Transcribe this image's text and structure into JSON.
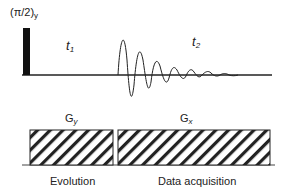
{
  "pulse": {
    "label_main": "(π/2)",
    "label_sub": "y"
  },
  "periods": {
    "t1_main": "t",
    "t1_sub": "1",
    "t2_main": "t",
    "t2_sub": "2"
  },
  "gradients": {
    "gy_main": "G",
    "gy_sub": "y",
    "gx_main": "G",
    "gx_sub": "x"
  },
  "phases": {
    "evolution": "Evolution",
    "acquisition": "Data acquisition"
  },
  "colors": {
    "ink": "#222222",
    "background": "#ffffff"
  }
}
